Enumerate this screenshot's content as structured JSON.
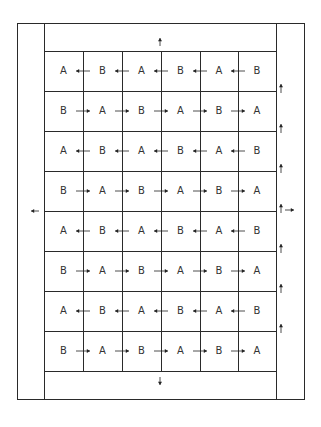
{
  "diagram": {
    "colors": {
      "line": "#2a2a2a",
      "text": "#333333",
      "arrow": "#222222"
    },
    "frame": {
      "outer": [
        17,
        23,
        304,
        399
      ],
      "inner_left": 44,
      "inner_right": 276,
      "grid_top": 51,
      "grid_bottom": 371
    },
    "columns_x": [
      44,
      83,
      122,
      161,
      200,
      238,
      276
    ],
    "rows_y": [
      51,
      91,
      131,
      171,
      211,
      251,
      291,
      331,
      371
    ],
    "rows": [
      {
        "cells": [
          "A",
          "B",
          "A",
          "B",
          "A",
          "B"
        ],
        "direction": "left"
      },
      {
        "cells": [
          "B",
          "A",
          "B",
          "A",
          "B",
          "A"
        ],
        "direction": "right"
      },
      {
        "cells": [
          "A",
          "B",
          "A",
          "B",
          "A",
          "B"
        ],
        "direction": "left"
      },
      {
        "cells": [
          "B",
          "A",
          "B",
          "A",
          "B",
          "A"
        ],
        "direction": "right"
      },
      {
        "cells": [
          "A",
          "B",
          "A",
          "B",
          "A",
          "B"
        ],
        "direction": "left"
      },
      {
        "cells": [
          "B",
          "A",
          "B",
          "A",
          "B",
          "A"
        ],
        "direction": "right"
      },
      {
        "cells": [
          "A",
          "B",
          "A",
          "B",
          "A",
          "B"
        ],
        "direction": "left"
      },
      {
        "cells": [
          "B",
          "A",
          "B",
          "A",
          "B",
          "A"
        ],
        "direction": "right"
      }
    ],
    "edge_arrows": {
      "top": {
        "direction": "up",
        "x": 160,
        "y": 42
      },
      "bottom": {
        "direction": "down",
        "x": 160,
        "y": 381
      },
      "left": {
        "direction": "left",
        "x": 35,
        "y": 211
      },
      "right": {
        "direction": "right",
        "x": 290,
        "y": 210
      },
      "right_column_up": [
        91,
        131,
        171,
        211,
        251,
        291,
        331
      ]
    }
  }
}
